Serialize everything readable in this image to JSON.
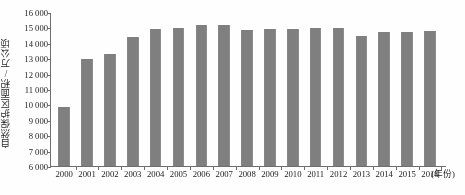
{
  "chart_data": {
    "type": "bar",
    "title": "",
    "xlabel": "(年份)",
    "ylabel": "自然保护区面积/万公顷",
    "categories": [
      "2000",
      "2001",
      "2002",
      "2003",
      "2004",
      "2005",
      "2006",
      "2007",
      "2008",
      "2009",
      "2010",
      "2011",
      "2012",
      "2013",
      "2014",
      "2015",
      "2016"
    ],
    "values": [
      9850,
      12980,
      13300,
      14400,
      14900,
      14950,
      15150,
      15150,
      14800,
      14900,
      14900,
      14950,
      14950,
      14450,
      14700,
      14700,
      14750
    ],
    "ylim": [
      6000,
      16000
    ],
    "yticks": [
      16000,
      15000,
      14000,
      13000,
      12000,
      11000,
      10000,
      9000,
      8000,
      7000,
      6000
    ],
    "ytick_labels": [
      "16 000",
      "15 000",
      "14 000",
      "13 000",
      "12 000",
      "11 000",
      "10 000",
      "9 000",
      "8 000",
      "7 000",
      "6 000"
    ],
    "grid": false,
    "legend": false,
    "bar_color": "#807f7f",
    "axis_color": "#6e6e6e"
  }
}
